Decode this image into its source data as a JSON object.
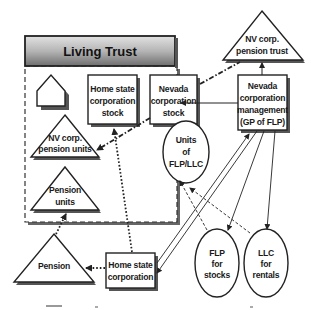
{
  "trust": {
    "title": "Living Trust"
  },
  "nodes": {
    "home_state_corp_stock": [
      "Home state",
      "corporation",
      "stock"
    ],
    "nevada_corp_stock": [
      "Nevada",
      "corporation",
      "stock"
    ],
    "nv_corp_pension_units": [
      "NV corp.",
      "pension units"
    ],
    "units_flp_llc": [
      "Units",
      "of",
      "FLP/LLC"
    ],
    "pension_units": [
      "Pension",
      "units"
    ],
    "nv_corp_pension_trust": [
      "NV corp.",
      "pension trust"
    ],
    "nevada_corp_management": [
      "Nevada",
      "corporation",
      "management",
      "(GP of FLP)"
    ],
    "pension": [
      "Pension"
    ],
    "home_state_corp": [
      "Home state",
      "corporation"
    ],
    "flp_for_stocks": [
      "FLP",
      "for",
      "stocks"
    ],
    "llc_for_rentals": [
      "LLC",
      "for",
      "rentals"
    ]
  },
  "colors": {
    "header_gradient_top": "#d9d9d9",
    "header_gradient_bottom": "#7a7a7a",
    "line": "#222222"
  }
}
